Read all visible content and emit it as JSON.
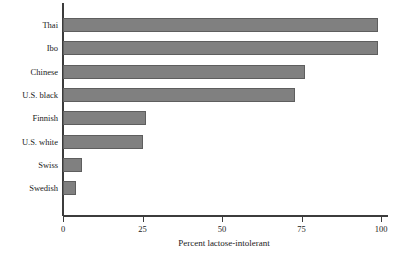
{
  "chart_data": {
    "type": "bar",
    "orientation": "horizontal",
    "title": "",
    "xlabel": "Percent lactose-intolerant",
    "ylabel": "",
    "categories": [
      "Thai",
      "Ibo",
      "Chinese",
      "U.S. black",
      "Finnish",
      "U.S. white",
      "Swiss",
      "Swedish"
    ],
    "values": [
      99,
      99,
      76,
      73,
      26,
      25,
      6,
      4
    ],
    "xlim": [
      0,
      100
    ],
    "xticks": [
      0,
      25,
      50,
      75,
      100
    ],
    "xtick_labels": [
      "0",
      "25",
      "50",
      "75",
      "100"
    ],
    "grid": false,
    "legend": null,
    "bar_color": "#808080",
    "bar_edge_color": "#5e5e5e",
    "axis_color": "#3c3c3c",
    "text_color": "#1a1a1a",
    "background_color": "#ffffff"
  }
}
